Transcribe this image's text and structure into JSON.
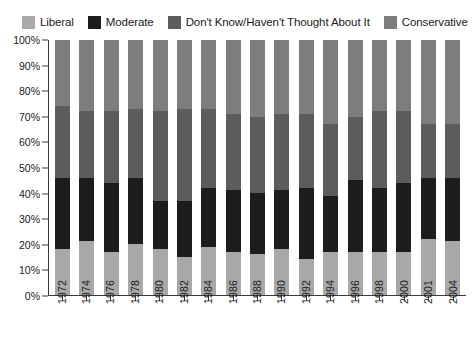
{
  "chart_data": {
    "type": "bar",
    "title": "",
    "xlabel": "",
    "ylabel": "",
    "ylim": [
      0,
      100
    ],
    "grid": false,
    "stacked": true,
    "stack_normalized": true,
    "legend_position": "top",
    "categories": [
      "1972",
      "1974",
      "1976",
      "1978",
      "1980",
      "1982",
      "1984",
      "1986",
      "1988",
      "1990",
      "1992",
      "1994",
      "1996",
      "1998",
      "2000",
      "2001",
      "2004"
    ],
    "ytick_labels": [
      "100%",
      "90%",
      "80%",
      "70%",
      "60%",
      "50%",
      "40%",
      "30%",
      "20%",
      "10%",
      "0%"
    ],
    "ytick_values": [
      100,
      90,
      80,
      70,
      60,
      50,
      40,
      30,
      20,
      10,
      0
    ],
    "series": [
      {
        "name": "Liberal",
        "color": "#a8a8a8",
        "values": [
          18,
          21,
          17,
          20,
          18,
          15,
          19,
          17,
          16,
          18,
          14,
          17,
          17,
          17,
          17,
          22,
          21
        ]
      },
      {
        "name": "Moderate",
        "color": "#1c1c1c",
        "values": [
          28,
          25,
          27,
          26,
          19,
          22,
          23,
          24,
          24,
          23,
          28,
          22,
          28,
          25,
          27,
          24,
          25
        ]
      },
      {
        "name": "Don't Know/Haven't Thought About It",
        "color": "#5c5c5c",
        "values": [
          28,
          26,
          28,
          27,
          35,
          36,
          31,
          30,
          30,
          30,
          29,
          28,
          25,
          30,
          28,
          21,
          21
        ]
      },
      {
        "name": "Conservative",
        "color": "#7d7d7d",
        "values": [
          26,
          28,
          28,
          27,
          28,
          27,
          27,
          29,
          30,
          29,
          29,
          33,
          30,
          28,
          28,
          33,
          33
        ]
      }
    ]
  },
  "legend": {
    "items": [
      {
        "label": "Liberal",
        "swatch_name": "legend-swatch-liberal"
      },
      {
        "label": "Moderate",
        "swatch_name": "legend-swatch-moderate"
      },
      {
        "label": "Don't Know/Haven't Thought About It",
        "swatch_name": "legend-swatch-dont-know"
      },
      {
        "label": "Conservative",
        "swatch_name": "legend-swatch-conservative"
      }
    ]
  },
  "colors": {
    "liberal": "#a8a8a8",
    "moderate": "#1c1c1c",
    "dont_know": "#5c5c5c",
    "conservative": "#7d7d7d",
    "axis": "#3a3a3a",
    "background": "#ffffff",
    "text": "#1a1a1a"
  }
}
